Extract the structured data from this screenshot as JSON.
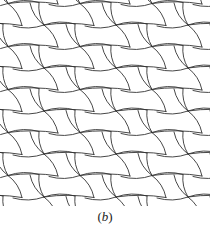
{
  "figure": {
    "caption_open": "(",
    "caption_letter": "b",
    "caption_close": ")",
    "stroke_color": "#333333",
    "background": "#ffffff"
  },
  "tiling": {
    "description": "Periodic tiling of curved-edge pentagonal tiles; 4-valent star vertices on a rhombic lattice",
    "star_origin": [
      8,
      25
    ],
    "star_step": [
      36,
      21.5
    ],
    "rows": 10,
    "cols": 7,
    "stroke_width": 0.9
  }
}
